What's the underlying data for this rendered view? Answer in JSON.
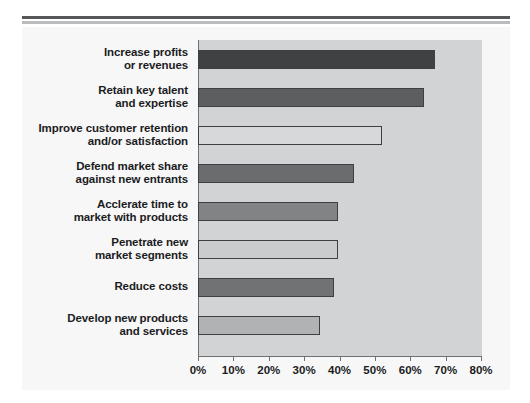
{
  "chart_data": {
    "type": "bar",
    "orientation": "horizontal",
    "title": "",
    "subtitle": "",
    "xlabel": "",
    "ylabel": "",
    "xlim": [
      0,
      80
    ],
    "xticks": [
      0,
      10,
      20,
      30,
      40,
      50,
      60,
      70,
      80
    ],
    "xticklabels": [
      "0%",
      "10%",
      "20%",
      "30%",
      "40%",
      "50%",
      "60%",
      "70%",
      "80%"
    ],
    "grid": false,
    "legend": null,
    "categories": [
      "Increase profits or revenues",
      "Retain key talent and expertise",
      "Improve customer retention and/or satisfaction",
      "Defend market share against new entrants",
      "Acclerate time to market with products",
      "Penetrate new market segments",
      "Reduce costs",
      "Develop new products and services"
    ],
    "values": [
      67,
      64,
      52,
      44,
      39.5,
      39.5,
      38.5,
      34.5
    ],
    "bars": [
      {
        "label_lines": [
          "Increase profits",
          "or revenues"
        ],
        "value": 67,
        "shade": "dark",
        "color": "#3f4143"
      },
      {
        "label_lines": [
          "Retain key talent",
          "and expertise"
        ],
        "value": 64,
        "shade": "medium",
        "color": "#5c5e60"
      },
      {
        "label_lines": [
          "Improve customer retention",
          "and/or satisfaction"
        ],
        "value": 52,
        "shade": "light",
        "color": "#d7d8d9"
      },
      {
        "label_lines": [
          "Defend market share",
          "against new entrants"
        ],
        "value": 44,
        "shade": "medium-dark",
        "color": "#6a6c6e"
      },
      {
        "label_lines": [
          "Acclerate time to",
          "market with products"
        ],
        "value": 39.5,
        "shade": "medium",
        "color": "#818385"
      },
      {
        "label_lines": [
          "Penetrate new",
          "market segments"
        ],
        "value": 39.5,
        "shade": "light",
        "color": "#cacbcc"
      },
      {
        "label_lines": [
          "Reduce costs"
        ],
        "value": 38.5,
        "shade": "medium-dark",
        "color": "#707274"
      },
      {
        "label_lines": [
          "Develop new products",
          "and services"
        ],
        "value": 34.5,
        "shade": "light-medium",
        "color": "#b0b2b4"
      }
    ]
  },
  "style": {
    "panel_bg": "#d2d3d4",
    "page_bg": "#f7f7f7",
    "axis_color": "#6e7072",
    "text_color": "#1b1c1e",
    "rule_dark": "#555759",
    "rule_light": "#b9bbbd"
  }
}
